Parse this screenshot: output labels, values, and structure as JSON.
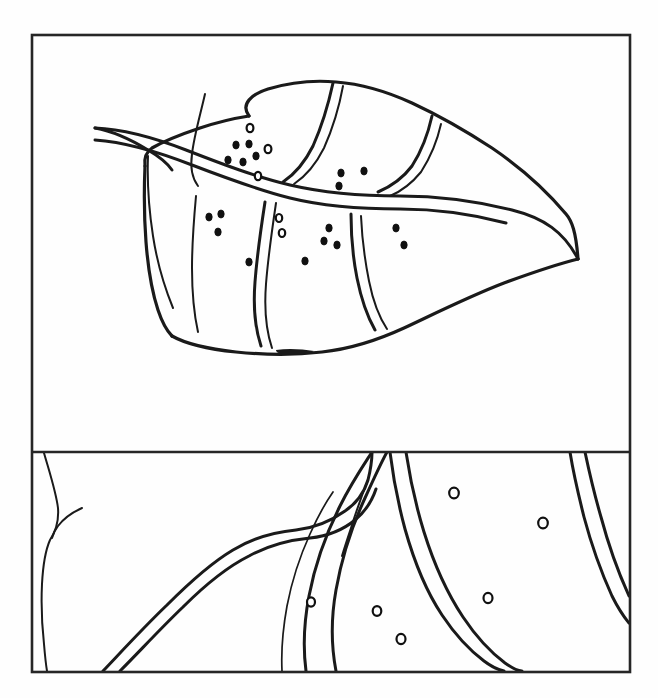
{
  "figure": {
    "title": "Leaf with spots — line drawing",
    "panel_count": 2,
    "background_color": "#fefefe",
    "ink_color": "#1a1a1a",
    "frame_color": "#262626",
    "width_px": 658,
    "height_px": 698
  },
  "frame": {
    "outer": {
      "x": 32,
      "y": 35,
      "width": 598,
      "height": 637
    },
    "divider_y": 452,
    "stroke_width": 2.6
  },
  "panels": [
    {
      "id": "upper-panel",
      "name": "whole-leaf-view",
      "bounds": {
        "x": 32,
        "y": 35,
        "width": 598,
        "height": 417
      },
      "description": "Whole leaf outline with midrib, lateral veins and scattered dark spots",
      "spot_count": 22,
      "vein_count": 9
    },
    {
      "id": "lower-panel",
      "name": "magnified-venation-view",
      "bounds": {
        "x": 32,
        "y": 452,
        "width": 598,
        "height": 220
      },
      "description": "Magnified detail of leaf venation showing vein junction and open ring spots",
      "spot_count": 6,
      "vein_count": 5
    }
  ],
  "upper_leaf": {
    "outline_path": "M 249 116 C 240 104 252 94 268 89 C 288 83 314 80 336 82 C 362 84 388 92 412 103 C 440 116 466 131 492 148 C 520 167 546 190 566 214 C 572 221 576 232 578 259 C 560 257 540 250 518 243 C 490 234 462 226 436 220 C 408 214 382 210 356 208 C 330 207 306 209 284 214 C 262 220 242 229 224 241 C 212 249 202 258 196 268",
    "lower_outline_path": "M 196 268 C 188 280 178 294 168 306 C 160 316 154 322 152 326 C 160 330 180 332 206 334 C 236 336 268 337 296 337 C 322 337 348 332 372 322 C 398 311 424 298 448 285 C 482 267 530 258 578 259",
    "midrib_path": "M 95 128 C 120 129 150 136 186 150 C 222 164 256 177 290 185 C 324 193 362 196 400 196 C 438 196 476 200 512 209 C 542 216 562 230 578 259",
    "midrib_second_path": "M 95 138 C 122 140 152 148 188 162 C 224 176 256 188 288 196 C 320 204 358 207 398 207 C 438 207 476 212 512 222"
  },
  "upper_veins": [
    {
      "id": "vein-1",
      "path": "M 204 91 C 198 112 192 132 190 150 C 188 164 190 174 196 182"
    },
    {
      "id": "vein-2",
      "path": "M 330 82 C 325 104 318 126 310 144 C 302 160 292 172 280 180"
    },
    {
      "id": "vein-3",
      "path": "M 340 84 C 336 106 330 128 322 146 C 314 162 304 172 292 182"
    },
    {
      "id": "vein-4",
      "path": "M 428 113 C 424 132 418 150 410 164 C 402 176 392 184 378 190"
    },
    {
      "id": "vein-5",
      "path": "M 147 151 C 146 176 148 204 152 230 C 156 256 163 280 172 302"
    },
    {
      "id": "vein-6",
      "path": "M 194 192 C 192 214 190 240 190 264 C 190 288 192 310 196 328"
    },
    {
      "id": "vein-7",
      "path": "M 264 198 C 260 224 256 252 254 278 C 252 304 254 326 260 344"
    },
    {
      "id": "vein-8",
      "path": "M 274 199 C 270 226 266 254 264 280 C 262 306 264 328 270 346"
    },
    {
      "id": "vein-9",
      "path": "M 352 212 C 352 234 354 256 358 276 C 362 296 368 314 376 328"
    },
    {
      "id": "vein-10",
      "path": "M 362 213 C 363 236 366 258 370 278 C 374 298 380 314 388 326"
    }
  ],
  "upper_spots": [
    {
      "x": 250,
      "y": 128,
      "rx": 3.4,
      "ry": 4.2,
      "style": "ring"
    },
    {
      "x": 236,
      "y": 145,
      "rx": 3.2,
      "ry": 4.0,
      "style": "filled"
    },
    {
      "x": 249,
      "y": 144,
      "rx": 3.2,
      "ry": 4.0,
      "style": "filled"
    },
    {
      "x": 268,
      "y": 149,
      "rx": 3.4,
      "ry": 4.2,
      "style": "ring"
    },
    {
      "x": 256,
      "y": 156,
      "rx": 3.2,
      "ry": 4.0,
      "style": "filled"
    },
    {
      "x": 228,
      "y": 160,
      "rx": 3.2,
      "ry": 4.0,
      "style": "filled"
    },
    {
      "x": 243,
      "y": 162,
      "rx": 3.2,
      "ry": 4.0,
      "style": "filled"
    },
    {
      "x": 258,
      "y": 176,
      "rx": 3.2,
      "ry": 4.2,
      "style": "ring"
    },
    {
      "x": 341,
      "y": 173,
      "rx": 3.2,
      "ry": 4.0,
      "style": "filled"
    },
    {
      "x": 364,
      "y": 171,
      "rx": 3.2,
      "ry": 4.0,
      "style": "filled"
    },
    {
      "x": 339,
      "y": 185,
      "rx": 3.2,
      "ry": 4.0,
      "style": "filled"
    },
    {
      "x": 209,
      "y": 217,
      "rx": 3.2,
      "ry": 4.0,
      "style": "filled"
    },
    {
      "x": 220,
      "y": 214,
      "rx": 3.2,
      "ry": 4.0,
      "style": "filled"
    },
    {
      "x": 218,
      "y": 232,
      "rx": 3.2,
      "ry": 4.0,
      "style": "filled"
    },
    {
      "x": 279,
      "y": 218,
      "rx": 3.2,
      "ry": 4.0,
      "style": "ring"
    },
    {
      "x": 282,
      "y": 232,
      "rx": 3.2,
      "ry": 4.0,
      "style": "ring"
    },
    {
      "x": 329,
      "y": 228,
      "rx": 3.2,
      "ry": 4.0,
      "style": "filled"
    },
    {
      "x": 324,
      "y": 241,
      "rx": 3.2,
      "ry": 4.0,
      "style": "filled"
    },
    {
      "x": 337,
      "y": 245,
      "rx": 3.2,
      "ry": 4.0,
      "style": "filled"
    },
    {
      "x": 249,
      "y": 262,
      "rx": 3.2,
      "ry": 4.0,
      "style": "filled"
    },
    {
      "x": 305,
      "y": 261,
      "rx": 3.2,
      "ry": 4.0,
      "style": "filled"
    },
    {
      "x": 396,
      "y": 228,
      "rx": 3.2,
      "ry": 4.0,
      "style": "filled"
    },
    {
      "x": 404,
      "y": 244,
      "rx": 3.2,
      "ry": 4.0,
      "style": "filled"
    }
  ],
  "upper_smudge": {
    "x": 295,
    "y": 352,
    "width": 42,
    "height": 5,
    "description": "small ink dash below leaf margin"
  },
  "lower_veins": [
    {
      "id": "lower-vein-left-edge",
      "path": "M 47 452 C 52 472 56 490 58 506 C 60 520 58 530 52 540 C 48 548 44 564 42 582 C 40 602 40 622 42 640 C 43 652 44 662 46 671"
    },
    {
      "id": "lower-vein-left-spur",
      "path": "M 78 508 C 70 514 62 520 56 528"
    },
    {
      "id": "lower-vein-branch-upper",
      "path": "M 105 670 C 124 650 146 626 168 604 C 190 582 212 562 234 548 C 254 536 276 530 296 528 C 314 526 330 520 344 510 C 356 502 362 494 364 486"
    },
    {
      "id": "lower-vein-branch-lower",
      "path": "M 118 671 C 136 652 158 628 180 606 C 202 584 224 566 246 554 C 266 543 288 538 308 536 C 326 534 342 528 354 518 C 364 510 370 500 372 490"
    },
    {
      "id": "lower-vein-midrib-left",
      "path": "M 304 671 C 302 650 303 626 308 600 C 314 568 324 538 338 510 C 350 486 362 468 372 452"
    },
    {
      "id": "lower-vein-midrib-right",
      "path": "M 334 671 C 330 646 330 620 334 592 C 340 558 350 524 362 498 C 372 476 380 462 386 452"
    },
    {
      "id": "lower-vein-fork-inner",
      "path": "M 380 452 C 377 468 372 486 367 504 C 362 520 358 532 355 541"
    },
    {
      "id": "lower-vein-right-branch-a",
      "path": "M 392 452 C 394 476 398 502 404 528 C 412 560 424 590 440 614 C 452 632 466 648 482 660"
    },
    {
      "id": "lower-vein-right-branch-b",
      "path": "M 404 452 C 408 478 414 506 422 532 C 432 564 444 592 460 616 C 472 634 486 650 502 662"
    },
    {
      "id": "lower-vein-right-edge-a",
      "path": "M 572 452 C 574 470 578 492 584 516 C 592 546 602 574 612 596"
    },
    {
      "id": "lower-vein-right-edge-b",
      "path": "M 586 452 C 589 470 594 492 600 516 C 608 546 618 574 628 596"
    }
  ],
  "lower_spots": [
    {
      "x": 311,
      "y": 602,
      "rx": 4.0,
      "ry": 4.6,
      "style": "ring"
    },
    {
      "x": 454,
      "y": 493,
      "rx": 4.6,
      "ry": 5.2,
      "style": "ring"
    },
    {
      "x": 543,
      "y": 523,
      "rx": 4.6,
      "ry": 5.2,
      "style": "ring"
    },
    {
      "x": 488,
      "y": 598,
      "rx": 4.4,
      "ry": 5.0,
      "style": "ring"
    },
    {
      "x": 377,
      "y": 611,
      "rx": 4.2,
      "ry": 4.8,
      "style": "ring"
    },
    {
      "x": 401,
      "y": 639,
      "rx": 4.4,
      "ry": 5.0,
      "style": "ring"
    }
  ],
  "legend": {
    "spot_label": "spot",
    "vein_label": "vein",
    "leaf_label": "leaf blade"
  }
}
